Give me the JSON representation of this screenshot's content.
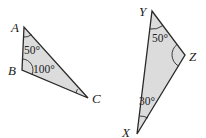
{
  "diagram": {
    "type": "geometry-triangles",
    "colors": {
      "fill": "#dcdcdc",
      "stroke": "#2a2a2a",
      "text": "#222222"
    },
    "triangles": [
      {
        "name": "ABC",
        "vertices": {
          "A": {
            "label": "A",
            "x": 24,
            "y": 27
          },
          "B": {
            "label": "B",
            "x": 22,
            "y": 70
          },
          "C": {
            "label": "C",
            "x": 88,
            "y": 98
          }
        },
        "angles": {
          "A": "50°",
          "B": "100°",
          "C": ""
        }
      },
      {
        "name": "XYZ",
        "vertices": {
          "Y": {
            "label": "Y",
            "x": 152,
            "y": 11
          },
          "Z": {
            "label": "Z",
            "x": 185,
            "y": 55
          },
          "X": {
            "label": "X",
            "x": 137,
            "y": 134
          }
        },
        "angles": {
          "Y": "50°",
          "Z": "",
          "X": "30°"
        }
      }
    ]
  }
}
